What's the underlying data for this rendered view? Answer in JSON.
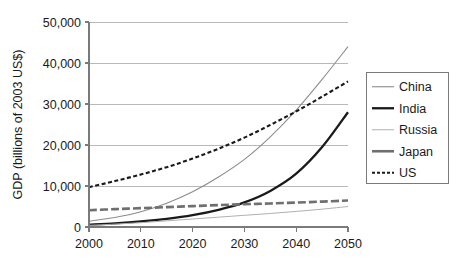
{
  "chart_data": {
    "type": "line",
    "title": "",
    "subtitle": "",
    "xlabel": "",
    "ylabel": "GDP (billions of 2003 US$)",
    "xlim": [
      2000,
      2050
    ],
    "ylim": [
      0,
      50000
    ],
    "xticks": [
      2000,
      2010,
      2020,
      2030,
      2040,
      2050
    ],
    "xtick_labels": [
      "2000",
      "2010",
      "2020",
      "2030",
      "2040",
      "2050"
    ],
    "yticks": [
      0,
      10000,
      20000,
      30000,
      40000,
      50000
    ],
    "ytick_labels": [
      "0",
      "10,000",
      "20,000",
      "30,000",
      "40,000",
      "50,000"
    ],
    "grid": "horizontal",
    "legend_position": "right-outside",
    "x": [
      2000,
      2005,
      2010,
      2015,
      2020,
      2025,
      2030,
      2035,
      2040,
      2045,
      2050
    ],
    "series": [
      {
        "name": "China",
        "values": [
          1400,
          2300,
          3700,
          5800,
          8600,
          12200,
          16500,
          22000,
          28500,
          36000,
          44000
        ],
        "color": "#8c8c8c",
        "width": 1.1,
        "dash": "none"
      },
      {
        "name": "India",
        "values": [
          600,
          900,
          1350,
          2000,
          2900,
          4200,
          6000,
          8800,
          13000,
          19500,
          28000
        ],
        "color": "#1a1a1a",
        "width": 2.3,
        "dash": "none"
      },
      {
        "name": "Russia",
        "values": [
          400,
          700,
          1050,
          1500,
          1950,
          2400,
          2850,
          3300,
          3800,
          4350,
          5000
        ],
        "color": "#b0b0b0",
        "width": 1.0,
        "dash": "none"
      },
      {
        "name": "Japan",
        "values": [
          4100,
          4350,
          4600,
          4850,
          5100,
          5350,
          5550,
          5750,
          5950,
          6200,
          6450
        ],
        "color": "#6f6f6f",
        "width": 2.6,
        "dash": "8,3"
      },
      {
        "name": "US",
        "values": [
          9700,
          11200,
          12800,
          14600,
          16700,
          19100,
          21800,
          24900,
          28200,
          31800,
          35500
        ],
        "color": "#1a1a1a",
        "width": 2.1,
        "dash": "4,2.5"
      }
    ],
    "legend_entries": [
      {
        "label": "China",
        "color": "#8c8c8c",
        "width": 1.1,
        "dash": "none"
      },
      {
        "label": "India",
        "color": "#1a1a1a",
        "width": 2.3,
        "dash": "none"
      },
      {
        "label": "Russia",
        "color": "#b0b0b0",
        "width": 1.0,
        "dash": "none"
      },
      {
        "label": "Japan",
        "color": "#6f6f6f",
        "width": 2.6,
        "dash": "none"
      },
      {
        "label": "US",
        "color": "#1a1a1a",
        "width": 2.1,
        "dash": "3,2"
      }
    ]
  }
}
